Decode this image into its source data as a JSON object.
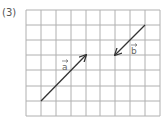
{
  "problem_label": "(3)",
  "grid": {
    "cols": 9,
    "rows": 7,
    "x_lines": [
      26,
      41,
      56,
      71,
      86,
      100,
      115,
      130,
      145,
      160
    ],
    "y_lines": [
      10,
      25,
      40,
      55,
      70,
      86,
      101,
      116
    ],
    "line_color": "#b0b0b0"
  },
  "vectors": [
    {
      "name": "a",
      "label": "a",
      "from": [
        41,
        101
      ],
      "to": [
        86,
        55
      ],
      "color": "#333333",
      "label_pos": [
        62,
        70
      ]
    },
    {
      "name": "b",
      "label": "b",
      "from": [
        145,
        25
      ],
      "to": [
        115,
        55
      ],
      "color": "#333333",
      "label_pos": [
        131,
        54
      ]
    }
  ]
}
